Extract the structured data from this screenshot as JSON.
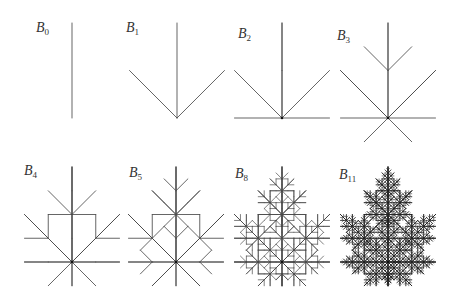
{
  "figure": {
    "stroke_color": "#4a4a4a",
    "dot_color": "#111111",
    "trunk_length": 95,
    "panels": [
      {
        "label": "B",
        "sub": "0",
        "level": 0,
        "root": [
          72,
          118
        ],
        "label_pos": [
          36,
          21
        ]
      },
      {
        "label": "B",
        "sub": "1",
        "level": 1,
        "root": [
          177,
          118
        ],
        "label_pos": [
          126,
          21
        ]
      },
      {
        "label": "B",
        "sub": "2",
        "level": 2,
        "root": [
          282,
          118
        ],
        "label_pos": [
          238,
          27
        ]
      },
      {
        "label": "B",
        "sub": "3",
        "level": 3,
        "root": [
          388,
          118
        ],
        "label_pos": [
          337,
          29
        ]
      },
      {
        "label": "B",
        "sub": "4",
        "level": 4,
        "root": [
          72,
          262
        ],
        "label_pos": [
          24,
          164
        ]
      },
      {
        "label": "B",
        "sub": "5",
        "level": 5,
        "root": [
          176,
          262
        ],
        "label_pos": [
          129,
          166
        ]
      },
      {
        "label": "B",
        "sub": "8",
        "level": 8,
        "root": [
          282,
          262
        ],
        "label_pos": [
          235,
          167
        ]
      },
      {
        "label": "B",
        "sub": "11",
        "level": 11,
        "root": [
          388,
          262
        ],
        "label_pos": [
          339,
          168
        ]
      }
    ]
  }
}
